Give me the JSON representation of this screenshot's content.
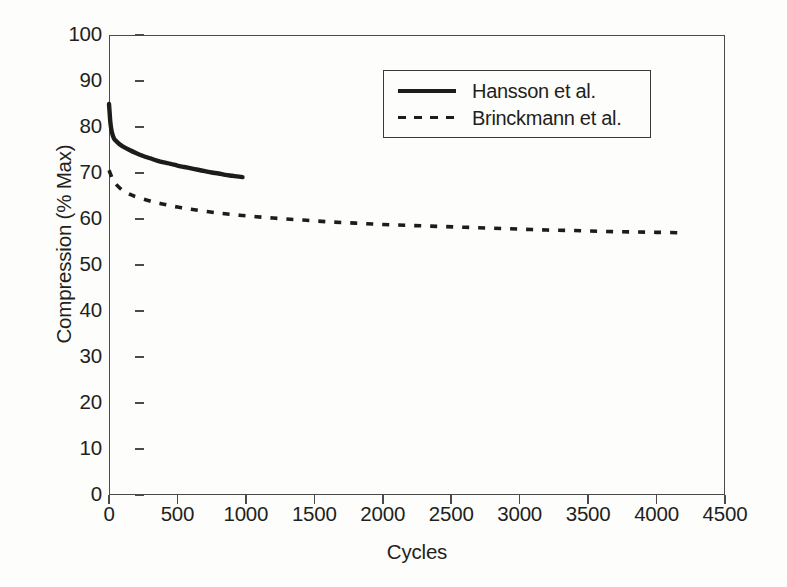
{
  "chart_data": {
    "type": "line",
    "title": "",
    "xlabel": "Cycles",
    "ylabel": "Compression (% Max)",
    "xlim": [
      0,
      4500
    ],
    "ylim": [
      0,
      100
    ],
    "xticks": [
      0,
      500,
      1000,
      1500,
      2000,
      2500,
      3000,
      3500,
      4000,
      4500
    ],
    "yticks": [
      0,
      10,
      20,
      30,
      40,
      50,
      60,
      70,
      80,
      90,
      100
    ],
    "grid": false,
    "legend_position": "upper-center-right",
    "series": [
      {
        "name": "Hansson et al.",
        "style": "solid",
        "color": "#1c1c1c",
        "x": [
          0,
          5,
          10,
          20,
          35,
          50,
          75,
          100,
          150,
          200,
          250,
          300,
          350,
          400,
          450,
          500,
          550,
          600,
          650,
          700,
          750,
          800,
          850,
          900,
          950,
          975
        ],
        "y": [
          85.0,
          83.0,
          81.0,
          79.0,
          77.6,
          77.0,
          76.3,
          75.8,
          75.0,
          74.3,
          73.7,
          73.2,
          72.7,
          72.3,
          72.0,
          71.6,
          71.3,
          71.0,
          70.7,
          70.4,
          70.1,
          69.9,
          69.6,
          69.4,
          69.2,
          69.1
        ]
      },
      {
        "name": "Brinckmann et al.",
        "style": "dashed",
        "color": "#1c1c1c",
        "x": [
          0,
          25,
          50,
          100,
          150,
          200,
          300,
          400,
          500,
          600,
          800,
          1000,
          1200,
          1400,
          1600,
          1800,
          2000,
          2200,
          2400,
          2600,
          2800,
          3000,
          3200,
          3400,
          3600,
          3800,
          4000,
          4200
        ],
        "y": [
          70.6,
          68.8,
          67.6,
          66.2,
          65.4,
          64.8,
          63.9,
          63.2,
          62.6,
          62.1,
          61.3,
          60.7,
          60.2,
          59.8,
          59.4,
          59.1,
          58.8,
          58.6,
          58.4,
          58.2,
          58.0,
          57.8,
          57.6,
          57.5,
          57.3,
          57.2,
          57.1,
          57.0
        ]
      }
    ]
  },
  "legend": {
    "entries": [
      {
        "label": "Hansson et al.",
        "style": "solid"
      },
      {
        "label": "Brinckmann et al.",
        "style": "dashed"
      }
    ]
  },
  "axes": {
    "x_title": "Cycles",
    "y_title": "Compression (% Max)",
    "x_tick_labels": [
      "0",
      "500",
      "1000",
      "1500",
      "2000",
      "2500",
      "3000",
      "3500",
      "4000",
      "4500"
    ],
    "y_tick_labels": [
      "0",
      "10",
      "20",
      "30",
      "40",
      "50",
      "60",
      "70",
      "80",
      "90",
      "100"
    ]
  },
  "colors": {
    "ink": "#1c1c1c",
    "axis": "#4a4a4a",
    "background": "#fdfdfb"
  }
}
